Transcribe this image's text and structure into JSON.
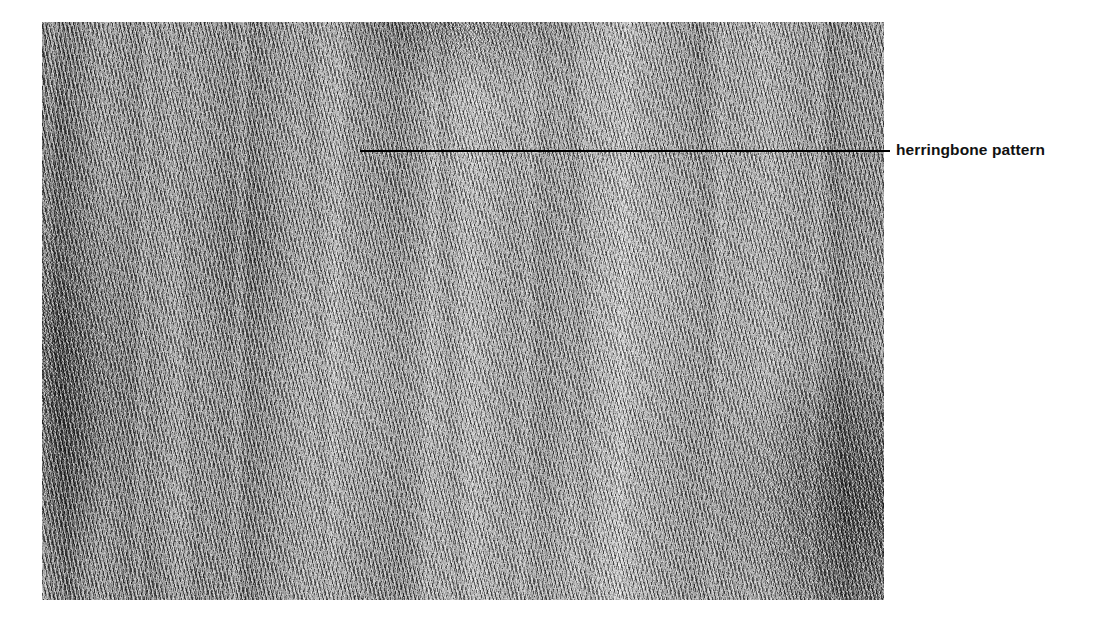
{
  "figure": {
    "kind": "histopathology-micrograph",
    "staining": "grayscale H&E photomicrograph",
    "annotations": [
      {
        "id": "herringbone",
        "label": "herringbone pattern",
        "leader_line": {
          "color": "#000000",
          "thickness_px": 2,
          "start_x": 360,
          "end_x": 890,
          "y": 150
        },
        "label_position": {
          "x": 896,
          "y": 141
        }
      }
    ],
    "plate": {
      "x": 42,
      "y": 22,
      "width": 842,
      "height": 578,
      "description": "Densely cellular spindle cell proliferation arranged in long intersecting fascicles producing a herringbone architecture; alternating pale and dark vertical bands with hypercellular zones at the left margin and lower right corner.",
      "background_color": "#8a8a8a",
      "accent_color": "#000000"
    }
  },
  "page": {
    "background_color": "#ffffff",
    "width": 1099,
    "height": 625
  }
}
